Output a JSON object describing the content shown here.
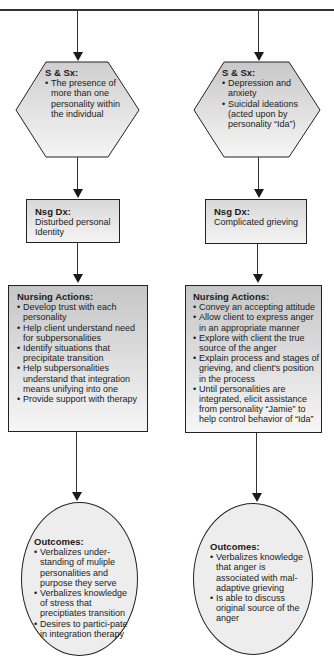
{
  "colors": {
    "line": "#333333",
    "fill_top": "#d2d2d2",
    "fill_bottom": "#f4f4f4",
    "oval_fill": "#ececec"
  },
  "left": {
    "symptoms": {
      "title": "S & Sx:",
      "items": [
        "The presence of more than one personality within the individual"
      ]
    },
    "diagnosis": {
      "title": "Nsg Dx:",
      "text": "Disturbed personal Identity"
    },
    "actions": {
      "title": "Nursing Actions:",
      "items": [
        "Develop trust with each personality",
        "Help client understand need for subpersonalities",
        "Identify situations that precipitate transition",
        "Help subpersonalities understand that integration means unifying into one",
        "Provide support with therapy"
      ]
    },
    "outcomes": {
      "title": "Outcomes:",
      "items": [
        "Verbalizes under-standing of muliple personalities and purpose they serve",
        "Verbalizes knowledge of stress that preciptiates transition",
        "Desires to partici-pate in integration therapy"
      ]
    }
  },
  "right": {
    "symptoms": {
      "title": "S & Sx:",
      "items": [
        "Depression and anxiety",
        "Suicidal ideations (acted upon by personality “Ida”)"
      ]
    },
    "diagnosis": {
      "title": "Nsg Dx:",
      "text": "Complicated grieving"
    },
    "actions": {
      "title": "Nursing Actions:",
      "items": [
        "Convey an accepting attitude",
        "Allow client to express anger in an appropriate manner",
        "Explore with client the true source of the anger",
        "Explain process and stages of grieving, and client's position in the process",
        "Until personalities are integrated, elicit assistance from personality “Jamie” to help control behavior of “Ida”"
      ]
    },
    "outcomes": {
      "title": "Outcomes:",
      "items": [
        "Verbalizes knowledge that anger is associated with mal-adaptive grieving",
        "Is able to discuss original source of the anger"
      ]
    }
  }
}
